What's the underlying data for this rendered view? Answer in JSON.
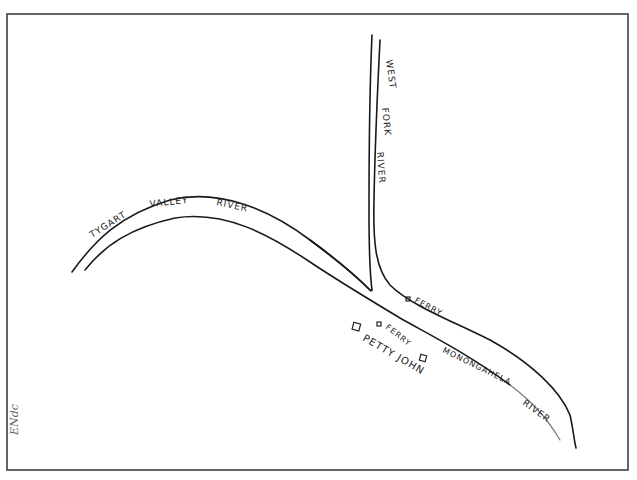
{
  "map": {
    "rivers": [
      {
        "name": "tygart-valley-river",
        "label": "TYGART VALLEY RIVER"
      },
      {
        "name": "west-fork-river",
        "label_parts": [
          "WEST",
          "FORK",
          "RIVER"
        ]
      },
      {
        "name": "monongahela-river",
        "label": "MONONGAHELA RIVER"
      }
    ],
    "labels": {
      "tygart": "TYGART",
      "valley": "VALLEY",
      "tygart_river": "RIVER",
      "west": "WEST",
      "fork": "FORK",
      "west_river": "RIVER",
      "monongahela": "MONONGAHELA",
      "mon_river": "RIVER",
      "ferry_north": "FERRY",
      "ferry_south": "FERRY",
      "pettyjohn": "PETTY JOHN"
    },
    "signature": "ENdc",
    "colors": {
      "ink": "#1a1a1a",
      "border": "#333333",
      "background": "#ffffff"
    }
  }
}
